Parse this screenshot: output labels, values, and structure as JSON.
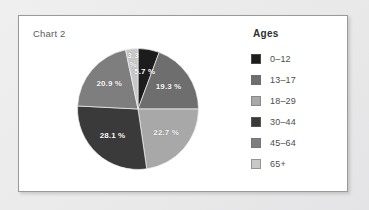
{
  "card": {
    "chart_title": "Chart 2"
  },
  "legend": {
    "title": "Ages",
    "items": [
      {
        "label": "0–12",
        "color": "#1c1c1c"
      },
      {
        "label": "13–17",
        "color": "#6e6e6e"
      },
      {
        "label": "18–29",
        "color": "#a8a8a8"
      },
      {
        "label": "30–44",
        "color": "#3a3a3a"
      },
      {
        "label": "45–64",
        "color": "#7e7e7e"
      },
      {
        "label": "65+",
        "color": "#c8c8c8"
      }
    ]
  },
  "chart_data": {
    "type": "pie",
    "title": "Chart 2",
    "legend_title": "Ages",
    "legend_position": "right",
    "categories": [
      "0–12",
      "13–17",
      "18–29",
      "30–44",
      "45–64",
      "65+"
    ],
    "values": [
      5.7,
      19.3,
      22.7,
      28.1,
      20.9,
      3.3
    ],
    "unit": "%",
    "colors": [
      "#1c1c1c",
      "#6e6e6e",
      "#a8a8a8",
      "#3a3a3a",
      "#7e7e7e",
      "#c8c8c8"
    ],
    "data_labels": [
      "5.7 %",
      "19.3 %",
      "22.7 %",
      "28.1 %",
      "20.9 %",
      "3.3 %"
    ],
    "start_angle_deg": 0,
    "direction": "clockwise",
    "xlabel": "",
    "ylabel": ""
  }
}
